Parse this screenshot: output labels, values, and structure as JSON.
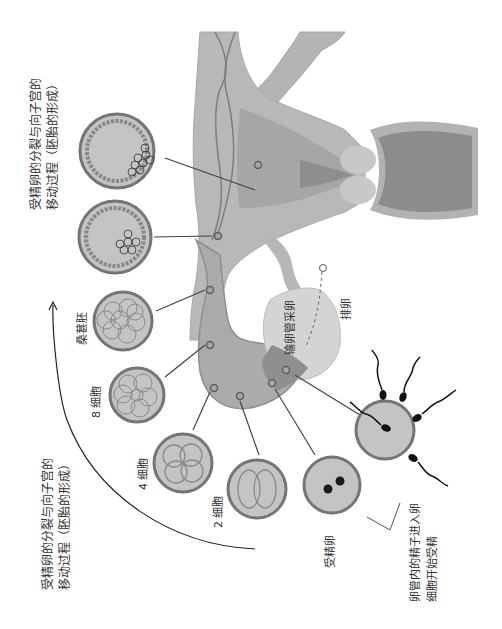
{
  "diagram": {
    "title_top": {
      "line1": "受精卵的分裂与向子宫的",
      "line2": "移动过程（胚胎的形成）"
    },
    "title_bottom": {
      "line1": "受精卵的分裂与向子宫的",
      "line2": "移动过程（胚胎的形成）"
    },
    "stages": [
      {
        "id": "fertilized-egg",
        "label": "受精卵"
      },
      {
        "id": "two-cell",
        "label": "2 细胞"
      },
      {
        "id": "four-cell",
        "label": "4 细胞"
      },
      {
        "id": "eight-cell",
        "label": "8 细胞"
      },
      {
        "id": "morula",
        "label": "桑葚胚"
      },
      {
        "id": "early-blastocyst",
        "label": ""
      },
      {
        "id": "blastocyst",
        "label": ""
      }
    ],
    "labels": {
      "ovulation": "排卵",
      "fimbria": "输卵管采卵",
      "fertilization_line1": "卵管内的精子进入卵",
      "fertilization_line2": "细胞开始受精"
    },
    "colors": {
      "tissue_light": "#c4c4c4",
      "tissue_mid": "#acacac",
      "tissue_dark": "#8e8e8e",
      "outline": "#6f6f6f",
      "cell_fill": "#c8c8c8",
      "cell_ring": "#777777",
      "ink": "#222222",
      "text": "#333333"
    }
  }
}
